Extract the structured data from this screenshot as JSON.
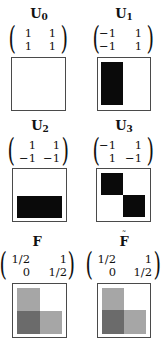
{
  "colors": {
    "black": "#0a0a0a",
    "light_gray": "#a6a6a6",
    "dark_gray": "#6b6b6b",
    "border": "#4a4a4a"
  },
  "panels": [
    {
      "id": "U0",
      "label": "U",
      "subscript": "0",
      "tilde": false,
      "matrix": [
        [
          "1",
          "1"
        ],
        [
          "1",
          "1"
        ]
      ],
      "pattern": "empty"
    },
    {
      "id": "U1",
      "label": "U",
      "subscript": "1",
      "tilde": false,
      "matrix": [
        [
          "−1",
          "1"
        ],
        [
          "−1",
          "1"
        ]
      ],
      "pattern": "left-half-black"
    },
    {
      "id": "U2",
      "label": "U",
      "subscript": "2",
      "tilde": false,
      "matrix": [
        [
          "1",
          "1"
        ],
        [
          "−1",
          "−1"
        ]
      ],
      "pattern": "bottom-half-black"
    },
    {
      "id": "U3",
      "label": "U",
      "subscript": "3",
      "tilde": false,
      "matrix": [
        [
          "−1",
          "1"
        ],
        [
          "1",
          "−1"
        ]
      ],
      "pattern": "diagonal-black"
    },
    {
      "id": "F",
      "label": "F",
      "subscript": "",
      "tilde": false,
      "matrix": [
        [
          "1/2",
          "1"
        ],
        [
          "0",
          "1/2"
        ]
      ],
      "pattern": "gray-L"
    },
    {
      "id": "F-tilde",
      "label": "F",
      "subscript": "",
      "tilde": true,
      "tilde_glyph": "˜",
      "matrix": [
        [
          "1/2",
          "1"
        ],
        [
          "0",
          "1/2"
        ]
      ],
      "pattern": "gray-L"
    }
  ]
}
